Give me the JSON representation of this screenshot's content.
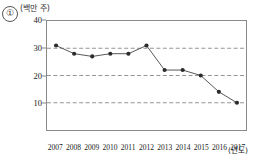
{
  "item_number": "①",
  "axes": {
    "y_unit_label": "(백만 주)",
    "x_unit_label": "(년도)",
    "y_ticks": [
      40,
      30,
      20,
      10
    ],
    "y_tick_labels": [
      "40",
      "30",
      "20",
      "10"
    ],
    "x_tick_labels": [
      "2007",
      "2008",
      "2009",
      "2010",
      "2011",
      "2012",
      "2013",
      "2014",
      "2015",
      "2016",
      "2017"
    ]
  },
  "style": {
    "line_color": "#555555",
    "marker_color": "#2b2b2b",
    "grid_color": "#777777",
    "frame_color": "#8a8a8a"
  },
  "chart_data": {
    "type": "line",
    "title": "",
    "xlabel": "(년도)",
    "ylabel": "(백만 주)",
    "x": [
      "2007",
      "2008",
      "2009",
      "2010",
      "2011",
      "2012",
      "2013",
      "2014",
      "2015",
      "2016",
      "2017"
    ],
    "values": [
      31,
      28,
      27,
      28,
      28,
      31,
      22,
      22,
      20,
      14,
      10
    ],
    "ylim": [
      0,
      40
    ],
    "yticks": [
      10,
      20,
      30,
      40
    ],
    "grid": "horizontal-dashed",
    "legend": "none",
    "markers": true
  }
}
